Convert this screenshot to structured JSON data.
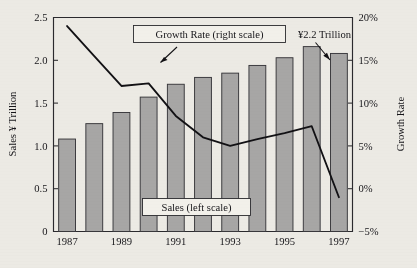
{
  "chart_data": {
    "type": "bar",
    "title": "",
    "subtitle": "",
    "xlabel": "",
    "ylabel": "Sales ¥ Trillion",
    "y2label": "Growth Rate",
    "grid": false,
    "legend_position": "inline-callouts",
    "categories": [
      "1987",
      "1988",
      "1989",
      "1990",
      "1991",
      "1992",
      "1993",
      "1994",
      "1995",
      "1996",
      "1997"
    ],
    "x_tick_labels": [
      "1987",
      "1989",
      "1991",
      "1993",
      "1995",
      "1997"
    ],
    "x_tick_categories": [
      "1987",
      "1989",
      "1991",
      "1993",
      "1995",
      "1997"
    ],
    "ylim": [
      0,
      2.5
    ],
    "y_ticks": [
      0,
      0.5,
      1.0,
      1.5,
      2.0,
      2.5
    ],
    "y_tick_labels": [
      "0",
      "0.5",
      "1.0",
      "1.5",
      "2.0",
      "2.5"
    ],
    "y2lim": [
      -5,
      20
    ],
    "y2_ticks": [
      -5,
      0,
      5,
      10,
      15,
      20
    ],
    "y2_tick_labels": [
      "−5%",
      "0%",
      "5%",
      "10%",
      "15%",
      "20%"
    ],
    "series": [
      {
        "name": "Sales (left scale)",
        "type": "bar",
        "axis": "left",
        "unit": "¥ Trillion",
        "color": "#a7a6a5",
        "values": [
          1.08,
          1.26,
          1.39,
          1.57,
          1.72,
          1.8,
          1.85,
          1.94,
          2.03,
          2.16,
          2.08
        ]
      },
      {
        "name": "Growth Rate (right scale)",
        "type": "line",
        "axis": "right",
        "unit": "%",
        "color": "#121114",
        "values": [
          19.0,
          15.5,
          12.0,
          12.3,
          8.5,
          6.0,
          5.0,
          5.8,
          6.5,
          7.3,
          -1.0
        ]
      }
    ],
    "annotations": [
      {
        "id": "growth-callout",
        "text": "Growth Rate (right scale)",
        "style": "boxed",
        "points_to": "1991"
      },
      {
        "id": "sales-callout",
        "text": "Sales (left scale)",
        "style": "boxed",
        "points_to": "bars"
      },
      {
        "id": "value-callout",
        "text": "¥2.2 Trillion",
        "style": "plain",
        "points_to": "1997"
      }
    ]
  },
  "axes": {
    "left_title": "Sales ¥ Trillion",
    "right_title": "Growth Rate"
  },
  "callouts": {
    "growth": "Growth Rate (right scale)",
    "sales": "Sales (left scale)",
    "value": "¥2.2 Trillion"
  },
  "colors": {
    "background": "#eceae4",
    "bar_fill": "#a7a6a5",
    "bar_stroke": "#37363a",
    "line": "#121114",
    "axis": "#2b2a2e",
    "text": "#17161a",
    "callout_fill": "#f2f0ea"
  }
}
